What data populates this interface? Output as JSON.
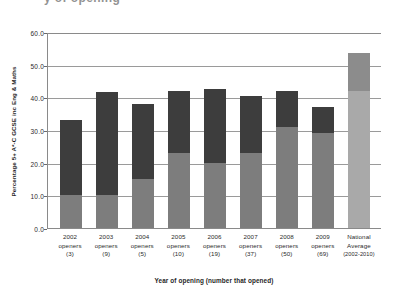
{
  "clipped_title": "y of opening",
  "chart_data": {
    "type": "bar",
    "subtype": "stacked-bar",
    "title": "y of opening",
    "xlabel": "Year of opening (number that opened)",
    "ylabel": "Percentage 5+ A*-C GCSE inc Eng & Maths",
    "ylim": [
      0.0,
      60.0
    ],
    "ytick_step": 10.0,
    "ytick_labels": [
      "60.0",
      "50.0",
      "40.0",
      "30.0",
      "20.0",
      "10.0",
      "0.0"
    ],
    "ytick_values": [
      60.0,
      50.0,
      40.0,
      30.0,
      20.0,
      10.0,
      0.0
    ],
    "grid": "horizontal",
    "legend": "none",
    "categories": [
      "2002 openers (3)",
      "2003 openers (9)",
      "2004 openers (5)",
      "2005 openers (10)",
      "2006 openers (19)",
      "2007 openers (37)",
      "2008 openers (50)",
      "2009 openers (69)",
      "National Average (2002-2010)"
    ],
    "category_lines": [
      [
        "2002",
        "openers",
        "(3)"
      ],
      [
        "2003",
        "openers",
        "(9)"
      ],
      [
        "2004",
        "openers",
        "(5)"
      ],
      [
        "2005",
        "openers",
        "(10)"
      ],
      [
        "2006",
        "openers",
        "(19)"
      ],
      [
        "2007",
        "openers",
        "(37)"
      ],
      [
        "2008",
        "openers",
        "(50)"
      ],
      [
        "2009",
        "openers",
        "(69)"
      ],
      [
        "National",
        "Average",
        "(2002-2010)"
      ]
    ],
    "series": [
      {
        "name": "Lower segment",
        "color": "#7d7d7d",
        "values": [
          10.0,
          10.0,
          15.0,
          23.0,
          20.0,
          23.0,
          31.0,
          29.0,
          42.0
        ]
      },
      {
        "name": "Upper segment",
        "color": "#3d3d3d",
        "values": [
          23.0,
          31.5,
          23.0,
          19.0,
          22.5,
          17.5,
          11.0,
          8.0,
          11.5
        ]
      }
    ],
    "totals": [
      33.0,
      41.5,
      38.0,
      42.0,
      42.5,
      40.5,
      42.0,
      37.0,
      53.5
    ],
    "average_bar_index": 8,
    "average_colors": {
      "lower": "#a9a9a9",
      "upper": "#8c8c8c"
    }
  },
  "colors": {
    "segment_upper": "#3d3d3d",
    "segment_lower": "#7d7d7d",
    "average_upper": "#8c8c8c",
    "average_lower": "#a9a9a9",
    "gridline": "#9a9a9a",
    "axis": "#8a8a8a",
    "background": "#ffffff"
  }
}
